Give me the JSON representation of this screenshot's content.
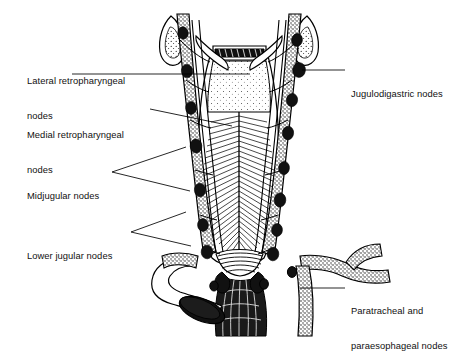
{
  "figure": {
    "background_color": "#ffffff",
    "ink_color": "#000000",
    "width": 475,
    "height": 337
  },
  "labels": [
    {
      "id": "lateral-retropharyngeal",
      "lines": [
        "Lateral retropharyngeal",
        "nodes"
      ],
      "side": "left",
      "x": 27,
      "y": 52,
      "leader": {
        "type": "line",
        "points": "72,74 250,74"
      }
    },
    {
      "id": "medial-retropharyngeal",
      "lines": [
        "Medial retropharyngeal",
        "nodes"
      ],
      "side": "left",
      "x": 27,
      "y": 106,
      "leader": {
        "type": "line",
        "points": "150,109 232,126"
      }
    },
    {
      "id": "midjugular",
      "lines": [
        "Midjugular nodes"
      ],
      "side": "left",
      "x": 27,
      "y": 167,
      "leader": {
        "type": "fork",
        "apex": "112,172",
        "branches": [
          "186,147",
          "190,191"
        ]
      }
    },
    {
      "id": "lower-jugular",
      "lines": [
        "Lower jugular nodes"
      ],
      "side": "left",
      "x": 27,
      "y": 227,
      "leader": {
        "type": "fork",
        "apex": "131,232",
        "branches": [
          "186,212",
          "191,246"
        ]
      }
    },
    {
      "id": "jugulodigastric",
      "lines": [
        "Jugulodigastric nodes"
      ],
      "side": "right",
      "x": 351,
      "y": 65,
      "leader": {
        "type": "line",
        "points": "302,70 345,70"
      }
    },
    {
      "id": "paratracheal-paraesophageal",
      "lines": [
        "Paratracheal and",
        "paraesophageal nodes"
      ],
      "side": "right",
      "x": 351,
      "y": 282,
      "leader": {
        "type": "line",
        "points": "300,288 345,288"
      }
    }
  ],
  "anatomy": {
    "structures": [
      "soft palate",
      "nasopharynx mucosa",
      "eustachian tube orifice left",
      "eustachian tube orifice right",
      "pharyngeal constrictor muscles",
      "carotid sheath left",
      "carotid sheath right",
      "internal jugular vein left",
      "internal jugular vein right",
      "esophagus",
      "subclavian vessels",
      "cut vessel stump"
    ],
    "node_count_left": 7,
    "node_count_right": 8
  }
}
